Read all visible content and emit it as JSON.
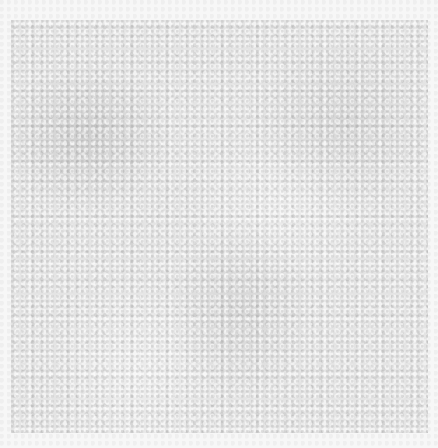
{
  "image": {
    "description": "Gray felt / paper texture swatch on a lighter border",
    "colors": {
      "border": "#f6f6f6",
      "swatch": "#e4e4e4"
    }
  }
}
